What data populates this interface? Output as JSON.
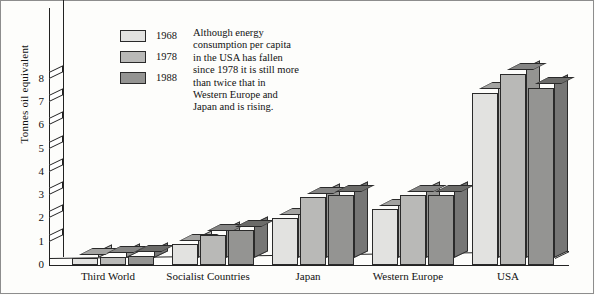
{
  "chart_data": {
    "type": "bar",
    "title": "",
    "xlabel": "",
    "ylabel": "Tonnes oil equivalent",
    "ylim": [
      0,
      8.4
    ],
    "yticks": [
      0,
      1,
      2,
      3,
      4,
      5,
      6,
      7,
      8
    ],
    "grid": false,
    "legend_position": "top-left",
    "projection": "3d-isometric",
    "categories": [
      "Third World",
      "Socialist Countries",
      "Japan",
      "Western Europe",
      "USA"
    ],
    "series": [
      {
        "name": "1968",
        "color": "#e2e2e0",
        "values": [
          0.3,
          0.9,
          2.0,
          2.4,
          7.4
        ]
      },
      {
        "name": "1978",
        "color": "#b9b9b7",
        "values": [
          0.35,
          1.3,
          2.9,
          3.0,
          8.2
        ]
      },
      {
        "name": "1988",
        "color": "#949492",
        "values": [
          0.4,
          1.5,
          3.0,
          3.0,
          7.6
        ]
      }
    ],
    "annotations": [
      "Although energy consumption per capita in the USA has fallen since 1978 it is still more than twice that in Western Europe and Japan and is rising."
    ]
  },
  "legend": {
    "items": [
      {
        "label": "1968",
        "color": "#e2e2e0"
      },
      {
        "label": "1978",
        "color": "#b9b9b7"
      },
      {
        "label": "1988",
        "color": "#949492"
      }
    ]
  },
  "note": {
    "text": "Although energy consumption per capita in the USA has fallen since 1978 it is still more than twice that in Western Europe and Japan and is rising."
  },
  "axis": {
    "y_label": "Tonnes oil equivalent",
    "y_ticks": [
      "0",
      "1",
      "2",
      "3",
      "4",
      "5",
      "6",
      "7",
      "8"
    ]
  },
  "colors": {
    "series_1968": "#e2e2e0",
    "series_1978": "#b9b9b7",
    "series_1988": "#949492",
    "outline": "#2a2a2a",
    "background": "#fdfdfb"
  }
}
